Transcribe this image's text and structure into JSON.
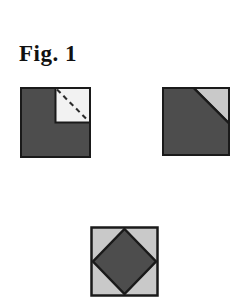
{
  "figure": {
    "caption": "Fig. 1",
    "background_color": "#ffffff",
    "outline_color": "#1a1a1a",
    "dark_fill": "#4d4d4d",
    "light_fill": "#c9c9c9",
    "paper_fill": "#f2f2f2",
    "dash_color": "#2b2b2b"
  },
  "panels": [
    {
      "id": "folded-corner",
      "name": "square-with-unfolded-corner",
      "label": "",
      "shape": "square",
      "size": 70,
      "inset": {
        "name": "unfolded-corner-flap",
        "shape": "square",
        "size": 35,
        "position": "top-right",
        "fold_line": "diagonal-dashed",
        "fold_line_from": "top-left",
        "fold_line_to": "bottom-right"
      }
    },
    {
      "id": "folded-triangle",
      "name": "square-with-folded-corner-triangle",
      "label": "",
      "shape": "square",
      "size": 67,
      "inset": {
        "name": "folded-corner-triangle",
        "shape": "triangle",
        "position": "top-right",
        "leg": 35
      }
    },
    {
      "id": "diamond",
      "name": "square-with-inscribed-diamond",
      "label": "",
      "shape": "square",
      "size": 68,
      "inset": {
        "name": "inscribed-diamond",
        "shape": "diamond",
        "vertices": "edge-midpoints"
      }
    }
  ]
}
